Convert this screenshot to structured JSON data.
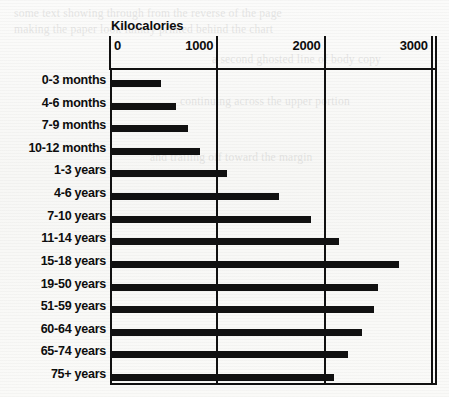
{
  "chart_data": {
    "type": "bar",
    "orientation": "horizontal",
    "title": "Kilocalories",
    "xlabel": "Kilocalories",
    "ylabel": "",
    "xlim": [
      0,
      3100
    ],
    "xticks": [
      0,
      1000,
      2000,
      3000
    ],
    "xtick_labels": [
      "0",
      "1000",
      "2000",
      "3000"
    ],
    "grid": true,
    "grid_axis": "x",
    "legend": false,
    "bar_color": "#111111",
    "categories": [
      "0-3 months",
      "4-6 months",
      "7-9 months",
      "10-12 months",
      "1-3 years",
      "4-6 years",
      "7-10 years",
      "11-14 years",
      "15-18 years",
      "19-50 years",
      "51-59 years",
      "60-64 years",
      "65-74 years",
      "75+ years"
    ],
    "values": [
      475,
      615,
      725,
      840,
      1090,
      1575,
      1875,
      2130,
      2690,
      2500,
      2465,
      2345,
      2220,
      2085
    ]
  },
  "background": {
    "ghost_lines": [
      "some text showing through from the reverse of the page",
      "making the paper look faintly printed behind the chart",
      "a second ghosted line of body copy",
      "continuing across the upper portion",
      "and trailing off toward the margin"
    ]
  }
}
